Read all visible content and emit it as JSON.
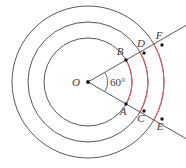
{
  "figure": {
    "background_color": "#ffffff",
    "stroke_color": "#58585a",
    "highlight_color": "#e35a63",
    "label_color": "#3b3b3b",
    "center": {
      "label": "O",
      "x": 88,
      "y": 82
    },
    "angle": {
      "label": "60°",
      "value": 60,
      "unit": "degrees",
      "x": 110,
      "y": 86
    },
    "circles": [
      {
        "name": "inner-circle",
        "radius": 44,
        "cx": 88,
        "cy": 82
      },
      {
        "name": "middle-circle",
        "radius": 60,
        "cx": 88,
        "cy": 82
      },
      {
        "name": "outer-circle",
        "radius": 76,
        "cx": 88,
        "cy": 82
      }
    ],
    "rays": [
      {
        "name": "upper-ray",
        "angle_deg": -30,
        "from_x": 88,
        "from_y": 82,
        "to_x": 186,
        "to_y": 25
      },
      {
        "name": "lower-ray",
        "angle_deg": 30,
        "from_x": 88,
        "from_y": 82,
        "to_x": 186,
        "to_y": 139
      }
    ],
    "points": [
      {
        "label": "A",
        "x": 126,
        "y": 104,
        "label_x": 123,
        "label_y": 115,
        "on": "inner-circle",
        "ray": "lower-ray"
      },
      {
        "label": "B",
        "x": 126,
        "y": 60,
        "label_x": 120,
        "label_y": 55,
        "on": "inner-circle",
        "ray": "upper-ray"
      },
      {
        "label": "C",
        "x": 144,
        "y": 111,
        "label_x": 141,
        "label_y": 122,
        "on": "middle-circle",
        "ray": "lower-ray"
      },
      {
        "label": "D",
        "x": 144,
        "y": 53,
        "label_x": 139,
        "label_y": 47,
        "on": "middle-circle",
        "ray": "upper-ray"
      },
      {
        "label": "E",
        "x": 162,
        "y": 119,
        "label_x": 159,
        "label_y": 130,
        "on": "outer-circle",
        "ray": "lower-ray"
      },
      {
        "label": "F",
        "x": 162,
        "y": 45,
        "label_x": 157,
        "label_y": 39,
        "on": "outer-circle",
        "ray": "upper-ray"
      }
    ],
    "highlight_arcs": [
      {
        "name": "inner-sector-arc",
        "radius": 44,
        "start_deg": -30,
        "end_deg": 30
      },
      {
        "name": "middle-sector-arc",
        "radius": 60,
        "start_deg": -30,
        "end_deg": 30
      },
      {
        "name": "outer-sector-arc",
        "radius": 76,
        "start_deg": -30,
        "end_deg": 30
      }
    ]
  }
}
